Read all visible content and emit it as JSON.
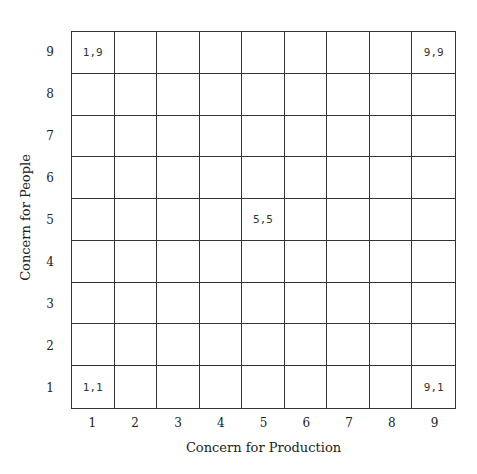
{
  "chart_data": {
    "type": "grid",
    "title": "",
    "xlabel": "Concern for Production",
    "ylabel": "Concern for People",
    "x_ticks": [
      "1",
      "2",
      "3",
      "4",
      "5",
      "6",
      "7",
      "8",
      "9"
    ],
    "y_ticks": [
      "9",
      "8",
      "7",
      "6",
      "5",
      "4",
      "3",
      "2",
      "1"
    ],
    "cells": [
      {
        "x": 1,
        "y": 9,
        "label": "1,9"
      },
      {
        "x": 9,
        "y": 9,
        "label": "9,9"
      },
      {
        "x": 5,
        "y": 5,
        "label": "5,5"
      },
      {
        "x": 1,
        "y": 1,
        "label": "1,1"
      },
      {
        "x": 9,
        "y": 1,
        "label": "9,1"
      }
    ],
    "grid_size": [
      9,
      9
    ]
  },
  "axes": {
    "xlabel": "Concern for Production",
    "ylabel": "Concern for People",
    "x_ticks": [
      "1",
      "2",
      "3",
      "4",
      "5",
      "6",
      "7",
      "8",
      "9"
    ],
    "y_ticks": [
      "9",
      "8",
      "7",
      "6",
      "5",
      "4",
      "3",
      "2",
      "1"
    ]
  }
}
